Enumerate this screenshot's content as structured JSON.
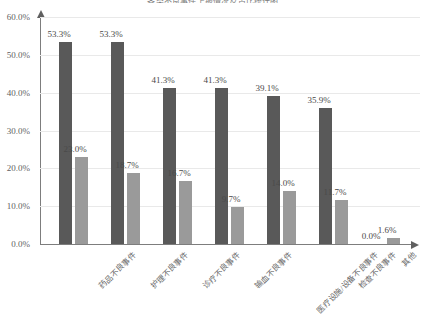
{
  "chart_data": {
    "type": "bar",
    "title": "各类不良事件上报情况及占比统计图",
    "xlabel": "",
    "ylabel": "",
    "ylim": [
      0,
      60
    ],
    "grid": true,
    "legend": "none",
    "y_ticks": [
      "0.0%",
      "10.0%",
      "20.0%",
      "30.0%",
      "40.0%",
      "50.0%",
      "60.0%"
    ],
    "y_tick_values": [
      0,
      10,
      20,
      30,
      40,
      50,
      60
    ],
    "categories": [
      "药品不良事件",
      "护理不良事件",
      "诊疗不良事件",
      "输血不良事件",
      "医疗设施/设备不良事件",
      "检查不良事件",
      "其他"
    ],
    "series": [
      {
        "name": "series-1",
        "color": "#595959",
        "values": [
          53.3,
          53.3,
          41.3,
          41.3,
          39.1,
          35.9,
          0.0
        ],
        "labels": [
          "53.3%",
          "53.3%",
          "41.3%",
          "41.3%",
          "39.1%",
          "35.9%",
          "0.0%"
        ]
      },
      {
        "name": "series-2",
        "color": "#9a9a9a",
        "values": [
          23.0,
          18.7,
          16.7,
          9.7,
          14.0,
          11.7,
          1.6
        ],
        "labels": [
          "23.0%",
          "18.7%",
          "16.7%",
          "9.7%",
          "14.0%",
          "11.7%",
          "1.6%"
        ]
      }
    ]
  }
}
